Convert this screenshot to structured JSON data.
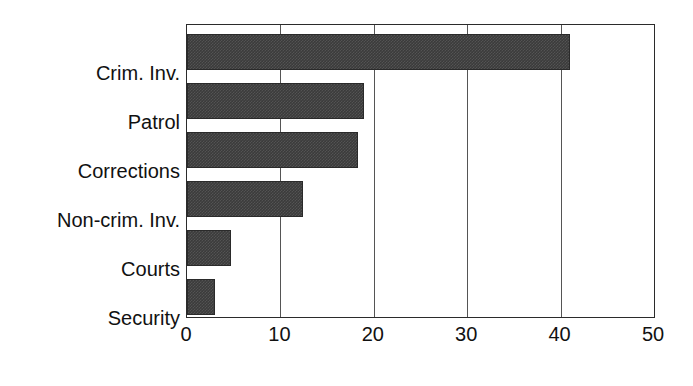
{
  "chart_data": {
    "type": "bar",
    "orientation": "horizontal",
    "title": "",
    "subtitle": "",
    "xlabel": "",
    "ylabel": "",
    "categories": [
      "Crim. Inv.",
      "Patrol",
      "Corrections",
      "Non-crim. Inv.",
      "Courts",
      "Security"
    ],
    "values": [
      41,
      19,
      18.3,
      12.4,
      4.7,
      3
    ],
    "series": [
      {
        "name": "",
        "values": [
          41,
          19,
          18.3,
          12.4,
          4.7,
          3
        ]
      }
    ],
    "xlim": [
      0,
      50
    ],
    "xticks": [
      0,
      10,
      20,
      30,
      40,
      50
    ],
    "xtick_labels": [
      "0",
      "10",
      "20",
      "30",
      "40",
      "50"
    ],
    "grid": "vertical",
    "legend": "none",
    "bar_color": "#3b3b3b",
    "axis_color": "#2b2b2b",
    "gridline_color": "#555555",
    "background": "#ffffff"
  }
}
